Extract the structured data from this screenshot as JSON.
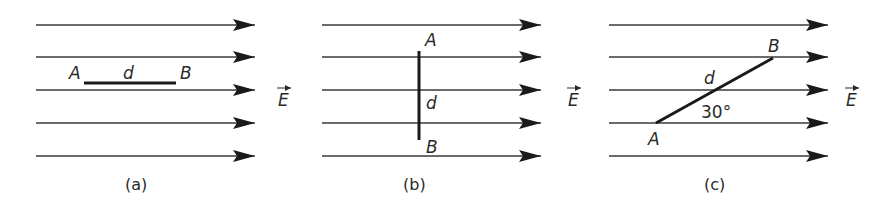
{
  "figure": {
    "field_symbol": "E",
    "colors": {
      "line": "#3a3a3a",
      "segment": "#1a1a1a",
      "text": "#2a2a2a",
      "background": "#ffffff"
    },
    "field_line_y": [
      25,
      57,
      90,
      123,
      156
    ],
    "panels": [
      {
        "id": "a",
        "caption": "(a)",
        "line_x_start": 36,
        "line_x_end": 255,
        "field_label": "E",
        "segment": {
          "x1": 84,
          "y1": 83,
          "x2": 176,
          "y2": 83,
          "orientation": "parallel to field"
        },
        "point_a": "A",
        "point_b": "B",
        "length_label": "d"
      },
      {
        "id": "b",
        "caption": "(b)",
        "line_x_start": 322,
        "line_x_end": 541,
        "field_label": "E",
        "segment": {
          "x1": 419,
          "y1": 51,
          "x2": 419,
          "y2": 140,
          "orientation": "perpendicular to field"
        },
        "point_a": "A",
        "point_b": "B",
        "length_label": "d"
      },
      {
        "id": "c",
        "caption": "(c)",
        "line_x_start": 609,
        "line_x_end": 828,
        "field_label": "E",
        "segment": {
          "x1": 656,
          "y1": 123,
          "x2": 773,
          "y2": 58,
          "orientation": "30 degrees to field"
        },
        "point_a": "A",
        "point_b": "B",
        "length_label": "d",
        "angle_label": "30°"
      }
    ]
  }
}
